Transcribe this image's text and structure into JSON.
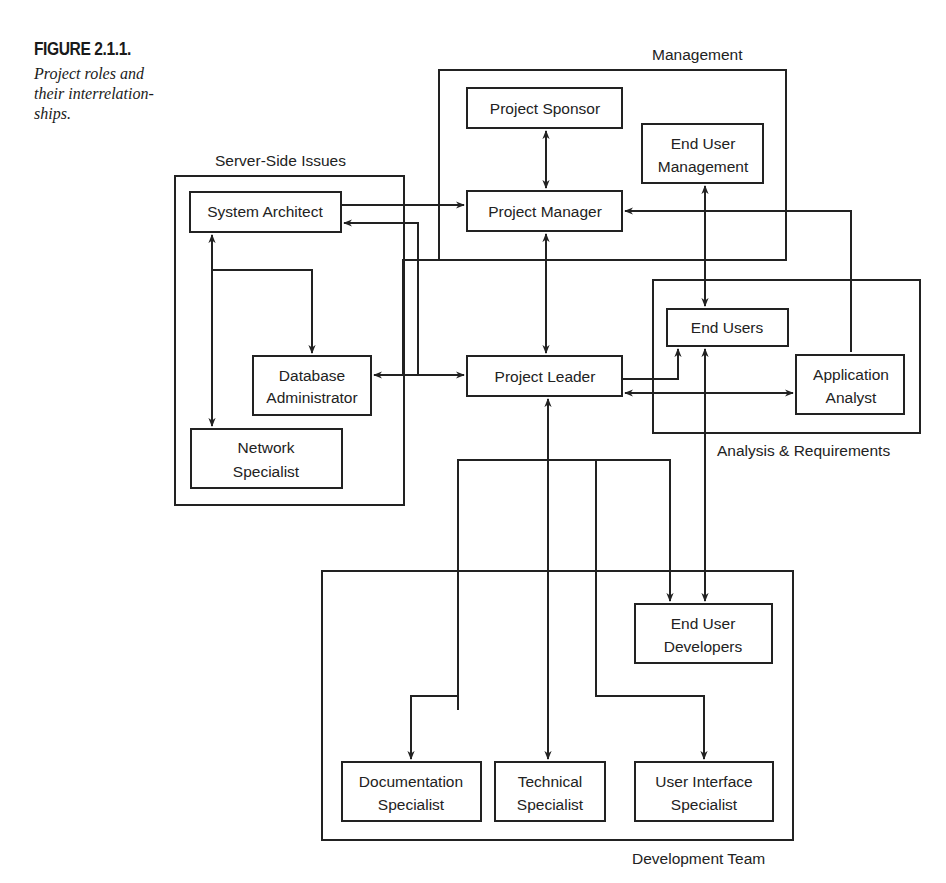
{
  "figure": {
    "label": "FIGURE 2.1.1.",
    "caption": "Project roles and their interrelation-ships."
  },
  "groups": {
    "management": "Management",
    "server_side": "Server-Side Issues",
    "analysis": "Analysis & Requirements",
    "development": "Development Team"
  },
  "nodes": {
    "project_sponsor": [
      "Project Sponsor"
    ],
    "end_user_management": [
      "End User",
      "Management"
    ],
    "project_manager": [
      "Project Manager"
    ],
    "system_architect": [
      "System Architect"
    ],
    "database_administrator": [
      "Database",
      "Administrator"
    ],
    "network_specialist": [
      "Network",
      "Specialist"
    ],
    "project_leader": [
      "Project Leader"
    ],
    "end_users": [
      "End Users"
    ],
    "application_analyst": [
      "Application",
      "Analyst"
    ],
    "end_user_developers": [
      "End User",
      "Developers"
    ],
    "documentation_specialist": [
      "Documentation",
      "Specialist"
    ],
    "technical_specialist": [
      "Technical",
      "Specialist"
    ],
    "user_interface_specialist": [
      "User Interface",
      "Specialist"
    ]
  },
  "colors": {
    "stroke": "#222222",
    "background": "#ffffff"
  }
}
